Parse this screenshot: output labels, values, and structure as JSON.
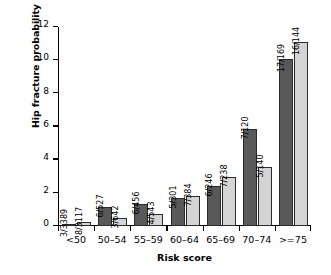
{
  "chart_data": {
    "type": "bar",
    "title": "",
    "xlabel": "Risk score",
    "ylabel": "Hip fracture probability (%)",
    "categories": [
      "<50",
      "50–54",
      "55–59",
      "60–64",
      "65–69",
      "70–74",
      ">=75"
    ],
    "ylim": [
      0,
      12
    ],
    "yticks": [
      0,
      2,
      4,
      6,
      8,
      10,
      12
    ],
    "ytick_labels": [
      "0",
      "2",
      "4",
      "6",
      "8",
      "10",
      "12"
    ],
    "grid": false,
    "legend": "none",
    "series": [
      {
        "name": "series-a",
        "color": "#595959",
        "values": [
          0.09,
          1.14,
          1.32,
          1.66,
          2.44,
          5.83,
          10.06
        ],
        "labels": [
          "3/3389",
          "6/527",
          "6/456",
          "5/301",
          "6/246",
          "7/120",
          "17/169"
        ]
      },
      {
        "name": "series-b",
        "color": "#d4d4d4",
        "values": [
          0.26,
          0.47,
          0.74,
          1.82,
          2.94,
          3.57,
          11.11
        ],
        "labels": [
          "8/3117",
          "3/642",
          "4/543",
          "7/384",
          "7/238",
          "5/140",
          "16/144"
        ]
      }
    ]
  }
}
